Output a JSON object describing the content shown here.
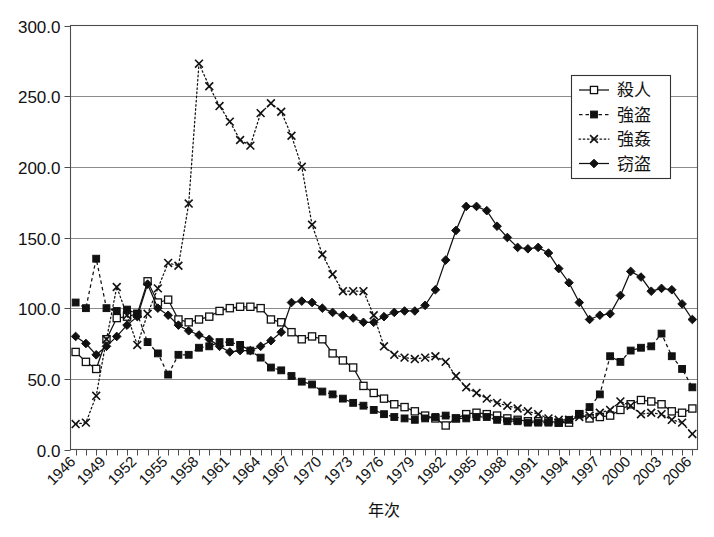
{
  "chart_data": {
    "type": "line",
    "title": "",
    "xlabel": "年次",
    "ylabel": "",
    "ylim": [
      0,
      300
    ],
    "ytick_step": 50,
    "ytick_labels": [
      "0.0",
      "50.0",
      "100.0",
      "150.0",
      "200.0",
      "250.0",
      "300.0"
    ],
    "grid": true,
    "legend_position": "top-right",
    "x": [
      1946,
      1947,
      1948,
      1949,
      1950,
      1951,
      1952,
      1953,
      1954,
      1955,
      1956,
      1957,
      1958,
      1959,
      1960,
      1961,
      1962,
      1963,
      1964,
      1965,
      1966,
      1967,
      1968,
      1969,
      1970,
      1971,
      1972,
      1973,
      1974,
      1975,
      1976,
      1977,
      1978,
      1979,
      1980,
      1981,
      1982,
      1983,
      1984,
      1985,
      1986,
      1987,
      1988,
      1989,
      1990,
      1991,
      1992,
      1993,
      1994,
      1995,
      1996,
      1997,
      1998,
      1999,
      2000,
      2001,
      2002,
      2003,
      2004,
      2005,
      2006
    ],
    "xtick_labels": [
      "1946",
      "1949",
      "1952",
      "1955",
      "1958",
      "1961",
      "1964",
      "1967",
      "1970",
      "1973",
      "1976",
      "1979",
      "1982",
      "1985",
      "1988",
      "1991",
      "1994",
      "1997",
      "2000",
      "2003",
      "2006"
    ],
    "xtick_step": 3,
    "series": [
      {
        "name": "殺人",
        "label": "殺人",
        "marker": "open-square",
        "line_style": "solid",
        "color": "#111111",
        "values": [
          69,
          62,
          57,
          78,
          93,
          94,
          96,
          119,
          104,
          106,
          92,
          90,
          92,
          94,
          98,
          100,
          101,
          101,
          100,
          92,
          90,
          83,
          78,
          80,
          78,
          68,
          63,
          58,
          45,
          40,
          36,
          32,
          30,
          27,
          24,
          22,
          17,
          22,
          25,
          26,
          25,
          24,
          22,
          21,
          20,
          20,
          20,
          19,
          19,
          25,
          22,
          23,
          24,
          28,
          32,
          35,
          34,
          32,
          27,
          26,
          29
        ]
      },
      {
        "name": "強盗",
        "label": "強盗",
        "marker": "filled-square",
        "line_style": "dashed",
        "color": "#111111",
        "values": [
          104,
          100,
          135,
          100,
          98,
          99,
          96,
          76,
          68,
          53,
          67,
          67,
          72,
          73,
          76,
          76,
          74,
          70,
          65,
          58,
          56,
          52,
          48,
          46,
          41,
          39,
          36,
          33,
          31,
          28,
          25,
          23,
          22,
          21,
          22,
          23,
          24,
          22,
          22,
          23,
          23,
          21,
          20,
          20,
          19,
          19,
          19,
          19,
          21,
          25,
          30,
          39,
          66,
          62,
          70,
          72,
          73,
          82,
          66,
          57,
          44
        ]
      },
      {
        "name": "強姦",
        "label": "強姦",
        "marker": "cross",
        "line_style": "dotted",
        "color": "#111111",
        "values": [
          18,
          19,
          38,
          78,
          115,
          95,
          74,
          96,
          114,
          132,
          130,
          174,
          273,
          257,
          243,
          232,
          219,
          215,
          238,
          245,
          239,
          222,
          200,
          159,
          138,
          124,
          112,
          112,
          112,
          95,
          73,
          67,
          65,
          64,
          65,
          66,
          62,
          52,
          44,
          40,
          36,
          33,
          31,
          29,
          27,
          25,
          22,
          21,
          21,
          23,
          24,
          26,
          28,
          34,
          31,
          25,
          26,
          25,
          21,
          19,
          11
        ]
      },
      {
        "name": "窃盗",
        "label": "窃盗",
        "marker": "filled-diamond",
        "line_style": "solid",
        "color": "#111111",
        "values": [
          80,
          75,
          67,
          73,
          80,
          88,
          94,
          117,
          100,
          95,
          88,
          84,
          81,
          78,
          73,
          69,
          70,
          70,
          73,
          77,
          83,
          104,
          105,
          104,
          100,
          97,
          95,
          93,
          90,
          90,
          94,
          97,
          98,
          98,
          102,
          113,
          134,
          155,
          172,
          172,
          169,
          158,
          150,
          143,
          142,
          143,
          139,
          128,
          118,
          104,
          92,
          95,
          96,
          109,
          126,
          122,
          112,
          114,
          113,
          103,
          92
        ]
      }
    ]
  },
  "axis": {
    "x_title": "年次"
  }
}
